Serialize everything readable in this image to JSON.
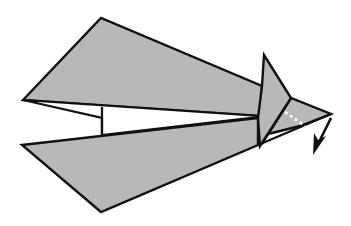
{
  "diagram": {
    "type": "origami-fold-step",
    "colors": {
      "paper": "#b8b8b8",
      "outline": "#111111",
      "background": "#ffffff",
      "dashed_fold_line": "#ffffff"
    },
    "elements": {
      "upper_wing": "upper-wing",
      "lower_wing": "lower-wing",
      "inner_gap": "white-inner-gap",
      "nose_flap": "nose-flap",
      "tip": "tip-flap",
      "fold_line": "valley-fold-dashed-line",
      "arrow": "fold-down-arrow"
    },
    "caption": "Fold the tip down along the dashed line."
  }
}
